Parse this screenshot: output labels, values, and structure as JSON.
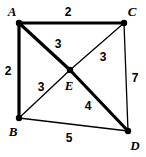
{
  "figure": {
    "type": "weighted-graph-diagram",
    "background_color": "#ffffff",
    "stroke_color": "#000000",
    "width": 146,
    "height": 157
  },
  "vertices": [
    {
      "id": "A",
      "label": "A",
      "x": 19,
      "y": 23,
      "label_x": 12,
      "label_y": 11,
      "dot_r": 3.2
    },
    {
      "id": "C",
      "label": "C",
      "x": 124,
      "y": 23,
      "label_x": 132,
      "label_y": 11,
      "dot_r": 3.2
    },
    {
      "id": "E",
      "label": "E",
      "x": 70,
      "y": 70,
      "label_x": 69,
      "label_y": 85,
      "dot_r": 3.2
    },
    {
      "id": "B",
      "label": "B",
      "x": 19,
      "y": 118,
      "label_x": 13,
      "label_y": 131,
      "dot_r": 3.2
    },
    {
      "id": "D",
      "label": "D",
      "x": 128,
      "y": 131,
      "label_x": 135,
      "label_y": 145,
      "dot_r": 3.2
    }
  ],
  "edges": [
    {
      "id": "AC",
      "from": "A",
      "to": "C",
      "weight": "2",
      "weight_x": 68,
      "weight_y": 12,
      "width": 3.2,
      "emphasis": "bold"
    },
    {
      "id": "AB",
      "from": "A",
      "to": "B",
      "weight": "2",
      "weight_x": 8,
      "weight_y": 71,
      "width": 3.2,
      "emphasis": "bold"
    },
    {
      "id": "AE",
      "from": "A",
      "to": "E",
      "weight": "3",
      "weight_x": 58,
      "weight_y": 44,
      "width": 3.2,
      "emphasis": "bold"
    },
    {
      "id": "ED",
      "from": "E",
      "to": "D",
      "weight": "4",
      "weight_x": 88,
      "weight_y": 106,
      "width": 3.2,
      "emphasis": "bold"
    },
    {
      "id": "CE",
      "from": "C",
      "to": "E",
      "weight": "3",
      "weight_x": 103,
      "weight_y": 57,
      "width": 1.3,
      "emphasis": "thin"
    },
    {
      "id": "CD",
      "from": "C",
      "to": "D",
      "weight": "7",
      "weight_x": 135,
      "weight_y": 78,
      "width": 1.3,
      "emphasis": "thin"
    },
    {
      "id": "BE",
      "from": "B",
      "to": "E",
      "weight": "3",
      "weight_x": 41,
      "weight_y": 87,
      "width": 1.3,
      "emphasis": "thin"
    },
    {
      "id": "BD",
      "from": "B",
      "to": "D",
      "weight": "5",
      "weight_x": 69,
      "weight_y": 138,
      "width": 1.3,
      "emphasis": "thin"
    }
  ]
}
